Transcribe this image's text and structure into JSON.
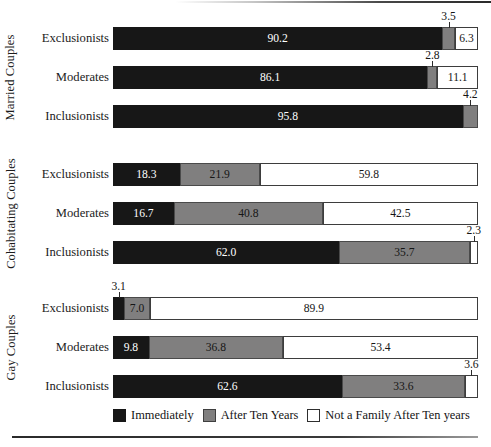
{
  "chart_data": {
    "type": "bar",
    "subtype": "stacked-horizontal-100",
    "title": "",
    "xlabel": "",
    "ylabel": "",
    "xlim": [
      0,
      100
    ],
    "grid": false,
    "legend_position": "bottom",
    "series": [
      {
        "name": "Immediately",
        "color": "#171717"
      },
      {
        "name": "After Ten Years",
        "color": "#807f7f"
      },
      {
        "name": "Not a Family After Ten years",
        "color": "#ffffff"
      }
    ],
    "groups": [
      {
        "label": "Married Couples",
        "rows": [
          {
            "label": "Exclusionists",
            "values": [
              90.2,
              3.5,
              6.3
            ],
            "callouts": [
              false,
              true,
              false
            ]
          },
          {
            "label": "Moderates",
            "values": [
              86.1,
              2.8,
              11.1
            ],
            "callouts": [
              false,
              true,
              false
            ]
          },
          {
            "label": "Inclusionists",
            "values": [
              95.8,
              4.2,
              0.0
            ],
            "callouts": [
              false,
              true,
              false
            ]
          }
        ]
      },
      {
        "label": "Cohabitating Couples",
        "rows": [
          {
            "label": "Exclusionists",
            "values": [
              18.3,
              21.9,
              59.8
            ],
            "callouts": [
              false,
              false,
              false
            ]
          },
          {
            "label": "Moderates",
            "values": [
              16.7,
              40.8,
              42.5
            ],
            "callouts": [
              false,
              false,
              false
            ]
          },
          {
            "label": "Inclusionists",
            "values": [
              62.0,
              35.7,
              2.3
            ],
            "callouts": [
              false,
              false,
              true
            ]
          }
        ]
      },
      {
        "label": "Gay Couples",
        "rows": [
          {
            "label": "Exclusionists",
            "values": [
              3.1,
              7.0,
              89.9
            ],
            "callouts": [
              true,
              false,
              false
            ]
          },
          {
            "label": "Moderates",
            "values": [
              9.8,
              36.8,
              53.4
            ],
            "callouts": [
              false,
              false,
              false
            ]
          },
          {
            "label": "Inclusionists",
            "values": [
              62.6,
              33.6,
              3.6
            ],
            "callouts": [
              false,
              false,
              true
            ]
          }
        ]
      }
    ]
  },
  "legend": {
    "items": [
      {
        "label": "Immediately",
        "swatch": "black"
      },
      {
        "label": "After Ten Years",
        "swatch": "gray"
      },
      {
        "label": "Not a Family After Ten years",
        "swatch": "white"
      }
    ]
  },
  "layout": {
    "bar_left": 113,
    "bar_right": 478,
    "bar_height": 23,
    "row_pitch": 39,
    "group_tops": [
      27,
      163,
      297
    ]
  }
}
